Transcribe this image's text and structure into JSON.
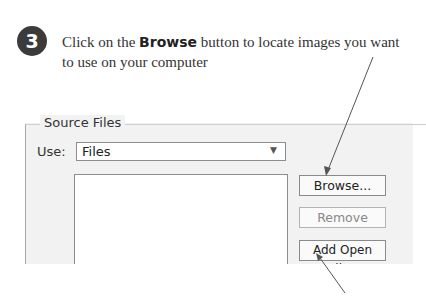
{
  "step": {
    "number": "3",
    "text_before": "Click on the ",
    "text_bold": "Browse",
    "text_after": " button to locate images you want to use on your computer"
  },
  "dialog": {
    "group_label": "Source Files",
    "use_label": "Use:",
    "use_select_value": "Files",
    "buttons": {
      "browse": "Browse...",
      "remove": "Remove",
      "add_open_files": "Add Open Files"
    }
  }
}
